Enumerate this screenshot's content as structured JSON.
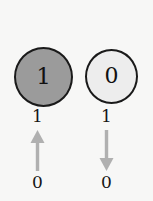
{
  "figure": {
    "background_color": "#f7f7f6",
    "columns": [
      {
        "id": "rising",
        "node": {
          "state_label": "1",
          "fill_color": "#9b9b9b",
          "stroke_color": "#1a1a1a",
          "filled": "true"
        },
        "transition": {
          "top_label": "1",
          "bottom_label": "0",
          "direction": "up",
          "arrow_icon": "arrow-up-icon",
          "arrow_color": "#b0b0b0"
        }
      },
      {
        "id": "falling",
        "node": {
          "state_label": "0",
          "fill_color": "#ededed",
          "stroke_color": "#1a1a1a",
          "filled": "false"
        },
        "transition": {
          "top_label": "1",
          "bottom_label": "0",
          "direction": "down",
          "arrow_icon": "arrow-down-icon",
          "arrow_color": "#b0b0b0"
        }
      }
    ]
  }
}
